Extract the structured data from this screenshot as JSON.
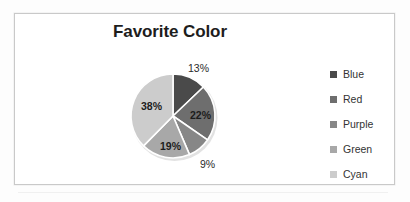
{
  "figure": {
    "title": "Favorite Color",
    "border_color": "#c9c9c9",
    "background": "#ffffff"
  },
  "legend": {
    "position": "right",
    "items": [
      {
        "label": "Blue",
        "color": "#4a4a4a",
        "swatch": "legend-swatch-blue"
      },
      {
        "label": "Red",
        "color": "#6e6e6e",
        "swatch": "legend-swatch-red"
      },
      {
        "label": "Purple",
        "color": "#878787",
        "swatch": "legend-swatch-purple"
      },
      {
        "label": "Green",
        "color": "#a8a8a8",
        "swatch": "legend-swatch-green"
      },
      {
        "label": "Cyan",
        "color": "#cccccc",
        "swatch": "legend-swatch-cyan"
      }
    ]
  },
  "labels": {
    "blue": "13%",
    "red": "22%",
    "purple": "9%",
    "green": "19%",
    "cyan": "38%"
  },
  "chart_data": {
    "type": "pie",
    "title": "Favorite Color",
    "xlabel": "",
    "ylabel": "",
    "categories": [
      "Blue",
      "Red",
      "Purple",
      "Green",
      "Cyan"
    ],
    "values": [
      13,
      22,
      9,
      19,
      38
    ],
    "value_unit": "percent",
    "data_labels": [
      "13%",
      "22%",
      "9%",
      "19%",
      "38%"
    ],
    "colors": [
      "#4a4a4a",
      "#6e6e6e",
      "#878787",
      "#a8a8a8",
      "#cccccc"
    ],
    "slice_order": "clockwise",
    "start_angle_deg": 0,
    "start_angle_note": "first slice begins at 12 o'clock",
    "separator_color": "#ffffff",
    "legend": {
      "show": true,
      "position": "right",
      "entries": [
        "Blue",
        "Red",
        "Purple",
        "Green",
        "Cyan"
      ]
    },
    "grid": false,
    "label_position": "mixed-inside-and-outside"
  }
}
